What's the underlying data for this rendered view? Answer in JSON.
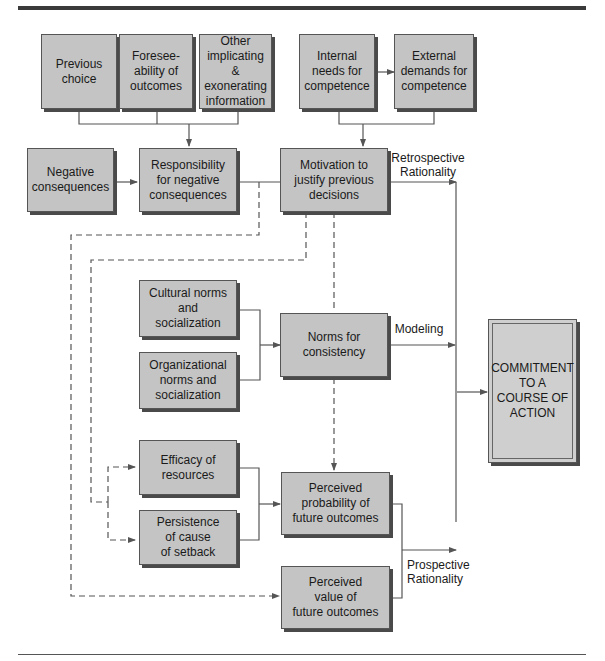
{
  "diagram": {
    "type": "flowchart",
    "boxes": {
      "previous_choice": "Previous\nchoice",
      "foreseeability": "Foresee-\nability of\noutcomes",
      "other_info": "Other\nimplicating &\nexonerating\ninformation",
      "internal_needs": "Internal\nneeds for\ncompetence",
      "external_demands": "External\ndemands for\ncompetence",
      "negative_consequences": "Negative\nconsequences",
      "responsibility": "Responsibility\nfor negative\nconsequences",
      "motivation": "Motivation to\njustify previous\ndecisions",
      "cultural_norms": "Cultural norms\nand\nsocialization",
      "organizational_norms": "Organizational\nnorms and\nsocialization",
      "norms_consistency": "Norms for\nconsistency",
      "efficacy": "Efficacy of\nresources",
      "persistence": "Persistence\nof cause\nof setback",
      "perceived_probability": "Perceived\nprobability of\nfuture outcomes",
      "perceived_value": "Perceived\nvalue of\nfuture outcomes",
      "commitment": "COMMITMENT\nTO A\nCOURSE OF\nACTION"
    },
    "labels": {
      "retrospective": "Retrospective\nRationality",
      "modeling": "Modeling",
      "prospective": "Prospective\nRationality"
    },
    "edges": [
      {
        "from": [
          "previous_choice",
          "foreseeability",
          "other_info"
        ],
        "to": "responsibility",
        "style": "solid"
      },
      {
        "from": "internal_needs",
        "to": "external_demands",
        "style": "solid-bidirectional"
      },
      {
        "from": [
          "internal_needs",
          "external_demands"
        ],
        "to": "motivation",
        "style": "solid"
      },
      {
        "from": "negative_consequences",
        "to": "responsibility",
        "style": "solid"
      },
      {
        "from": "responsibility",
        "to": "motivation",
        "style": "solid"
      },
      {
        "from": "motivation",
        "to": "commitment",
        "style": "solid",
        "label": "retrospective"
      },
      {
        "from": [
          "cultural_norms",
          "organizational_norms"
        ],
        "to": "norms_consistency",
        "style": "solid"
      },
      {
        "from": "norms_consistency",
        "to": "commitment",
        "style": "solid",
        "label": "modeling"
      },
      {
        "from": [
          "efficacy",
          "persistence"
        ],
        "to": "perceived_probability",
        "style": "solid"
      },
      {
        "from": [
          "perceived_probability",
          "perceived_value"
        ],
        "to": "commitment",
        "style": "solid",
        "label": "prospective"
      },
      {
        "from": "motivation",
        "to": "perceived_probability",
        "style": "dashed"
      },
      {
        "from": "motivation",
        "to": [
          "efficacy",
          "persistence"
        ],
        "style": "dashed"
      },
      {
        "from": "responsibility",
        "to": "perceived_value",
        "style": "dashed"
      }
    ]
  }
}
